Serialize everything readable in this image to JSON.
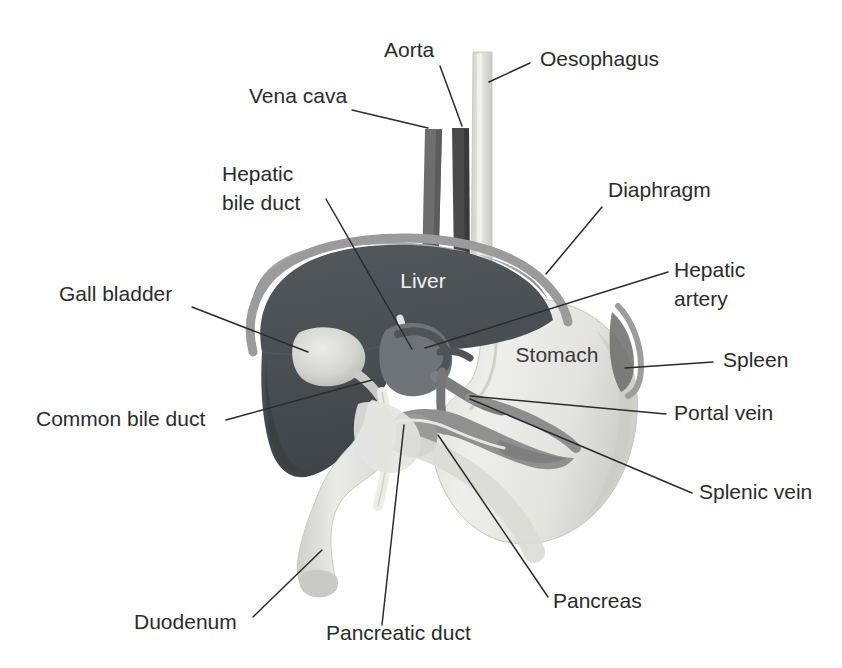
{
  "figure": {
    "background_color": "#ffffff",
    "line_color": "#2b2b2b",
    "text_color": "#2b2b2b"
  },
  "organ_labels": [
    {
      "id": "liver",
      "text": "Liver",
      "x": 423,
      "y": 288,
      "color": "#f2f2f2",
      "anchor": "middle"
    },
    {
      "id": "stomach",
      "text": "Stomach",
      "x": 557,
      "y": 362,
      "color": "#3a3a3a",
      "anchor": "middle"
    }
  ],
  "callouts": [
    {
      "id": "aorta",
      "text": "Aorta",
      "text_x": 384,
      "text_y": 57,
      "anchor": "start",
      "leader": "M 440 66 L 462 126"
    },
    {
      "id": "oesophagus",
      "text": "Oesophagus",
      "text_x": 540,
      "text_y": 66,
      "anchor": "start",
      "leader": "M 530 63 L 489 82"
    },
    {
      "id": "vena-cava",
      "text": "Vena cava",
      "text_x": 249,
      "text_y": 103,
      "anchor": "start",
      "leader": "M 352 110 L 428 128"
    },
    {
      "id": "hepatic-bile-duct",
      "text": "Hepatic",
      "text2": "bile duct",
      "text_x": 222,
      "text_y": 181,
      "text2_x": 222,
      "text2_y": 210,
      "anchor": "start",
      "leader": "M 326 199 L 412 349"
    },
    {
      "id": "diaphragm",
      "text": "Diaphragm",
      "text_x": 608,
      "text_y": 197,
      "anchor": "start",
      "leader": "M 602 207 L 546 274"
    },
    {
      "id": "hepatic-artery",
      "text": "Hepatic",
      "text2": "artery",
      "text_x": 674,
      "text_y": 277,
      "text2_x": 674,
      "text2_y": 306,
      "anchor": "start",
      "leader": "M 668 272 L 425 348"
    },
    {
      "id": "gall-bladder",
      "text": "Gall bladder",
      "text_x": 59,
      "text_y": 301,
      "anchor": "start",
      "leader": "M 192 307 L 308 352"
    },
    {
      "id": "spleen",
      "text": "Spleen",
      "text_x": 723,
      "text_y": 367,
      "anchor": "start",
      "leader": "M 713 362 L 625 368"
    },
    {
      "id": "common-bile-duct",
      "text": "Common bile duct",
      "text_x": 36,
      "text_y": 426,
      "anchor": "start",
      "leader": "M 226 420 L 372 380"
    },
    {
      "id": "portal-vein",
      "text": "Portal vein",
      "text_x": 674,
      "text_y": 420,
      "anchor": "start",
      "leader": "M 666 414 L 470 396"
    },
    {
      "id": "splenic-vein",
      "text": "Splenic vein",
      "text_x": 699,
      "text_y": 499,
      "anchor": "start",
      "leader": "M 692 493 L 470 399"
    },
    {
      "id": "pancreas",
      "text": "Pancreas",
      "text_x": 553,
      "text_y": 608,
      "anchor": "start",
      "leader": "M 548 597 L 438 435"
    },
    {
      "id": "pancreatic-duct",
      "text": "Pancreatic duct",
      "text_x": 326,
      "text_y": 640,
      "anchor": "start",
      "leader": "M 382 625 L 404 425"
    },
    {
      "id": "duodenum",
      "text": "Duodenum",
      "text_x": 134,
      "text_y": 629,
      "anchor": "start",
      "leader": "M 253 617 L 322 550"
    }
  ],
  "structures": [
    {
      "id": "liver",
      "name": "Liver",
      "color": "#4b5054"
    },
    {
      "id": "diaphragm",
      "name": "Diaphragm",
      "color": "#9b9b9b"
    },
    {
      "id": "stomach",
      "name": "Stomach",
      "color": "#e8e8e6"
    },
    {
      "id": "oesophagus",
      "name": "Oesophagus",
      "color": "#dcdcda"
    },
    {
      "id": "aorta",
      "name": "Aorta",
      "color": "#4a4a4a"
    },
    {
      "id": "vena-cava",
      "name": "Vena cava",
      "color": "#6e6e6e"
    },
    {
      "id": "gall-bladder",
      "name": "Gall bladder",
      "color": "#d2d2ce"
    },
    {
      "id": "duodenum",
      "name": "Duodenum",
      "color": "#dedede"
    },
    {
      "id": "pancreas",
      "name": "Pancreas",
      "color": "#8c8c8c"
    },
    {
      "id": "spleen",
      "name": "Spleen",
      "color": "#6b6b6b"
    },
    {
      "id": "portal-vein",
      "name": "Portal vein",
      "color": "#7a7a7a"
    },
    {
      "id": "splenic-vein",
      "name": "Splenic vein",
      "color": "#8a8a8a"
    },
    {
      "id": "hepatic-artery",
      "name": "Hepatic artery",
      "color": "#5a5a5a"
    },
    {
      "id": "bile-duct",
      "name": "Common bile duct",
      "color": "#efefef"
    },
    {
      "id": "pancreatic-duct",
      "name": "Pancreatic duct",
      "color": "#f2f2f2"
    }
  ]
}
